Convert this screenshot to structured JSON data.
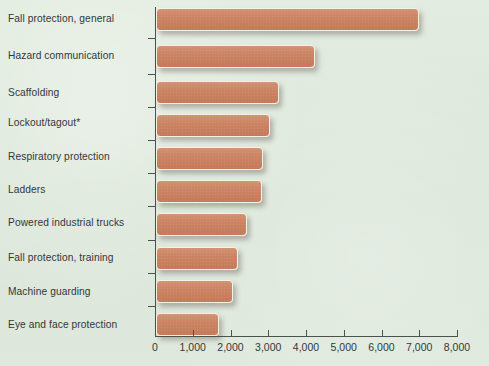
{
  "chart_data": {
    "type": "bar",
    "orientation": "horizontal",
    "title": "",
    "subtitle": "",
    "xlabel": "",
    "ylabel": "",
    "categories": [
      "Fall protection, general",
      "Hazard communication",
      "Scaffolding",
      "Lockout/tagout*",
      "Respiratory protection",
      "Ladders",
      "Powered industrial trucks",
      "Fall protection, training",
      "Machine guarding",
      "Eye and face protection"
    ],
    "values": [
      6980,
      4220,
      3260,
      3020,
      2845,
      2800,
      2420,
      2160,
      2030,
      1680
    ],
    "xlim": [
      0,
      8000
    ],
    "xticks": [
      0,
      1000,
      2000,
      3000,
      4000,
      5000,
      6000,
      7000,
      8000
    ],
    "xtick_labels": [
      "0",
      "1,000",
      "2,000",
      "3,000",
      "4,000",
      "5,000",
      "6,000",
      "7,000",
      "8,000"
    ],
    "grid": false,
    "legend": null,
    "annotations": [
      "*"
    ],
    "colors": {
      "background": "#dee8dc",
      "bar_fill": "#cb8464",
      "bar_border": "#f6f1e6",
      "axis": "#4a524d",
      "text": "#32373a"
    }
  }
}
